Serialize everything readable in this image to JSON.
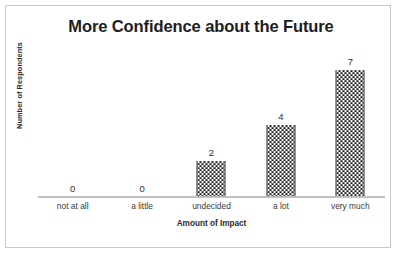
{
  "figure": {
    "background_color": "#ffffff",
    "border_color": "#c9c9c9",
    "axis_line_color": "#bfbfbf",
    "bar_color": "#1a1a1a",
    "text_color": "#303030"
  },
  "chart_data": {
    "type": "bar",
    "title": "More Confidence about the Future",
    "xlabel": "Amount of Impact",
    "ylabel": "Number of Respondents",
    "categories": [
      "not at all",
      "a little",
      "undecided",
      "a lot",
      "very much"
    ],
    "values": [
      0,
      0,
      2,
      4,
      7
    ],
    "value_labels": [
      "0",
      "0",
      "2",
      "4",
      "7"
    ],
    "ylim": [
      0,
      8
    ],
    "grid": false,
    "legend": false,
    "y_tick_labels": [],
    "x_tick_labels": [
      "not at all",
      "a little",
      "undecided",
      "a lot",
      "very much"
    ],
    "bar_fill": "checkerboard-pattern",
    "data_labels_shown": true
  }
}
